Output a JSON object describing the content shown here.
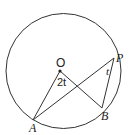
{
  "diagram": {
    "type": "circle-geometry",
    "circle": {
      "cx": 63.5,
      "cy": 71,
      "r": 57.5
    },
    "points": {
      "O": {
        "label": "O",
        "x": 60,
        "y": 71
      },
      "P": {
        "label": "P",
        "x": 114,
        "y": 58
      },
      "B": {
        "label": "B",
        "x": 102,
        "y": 108
      },
      "A": {
        "label": "A",
        "x": 33,
        "y": 120
      }
    },
    "segments": [
      [
        "O",
        "A"
      ],
      [
        "O",
        "B"
      ],
      [
        "A",
        "P"
      ],
      [
        "P",
        "B"
      ]
    ],
    "angles": {
      "AOB": {
        "label": "2t"
      },
      "APB": {
        "label": "t"
      }
    },
    "colors": {
      "stroke": "#333333",
      "background": "#ffffff"
    }
  }
}
